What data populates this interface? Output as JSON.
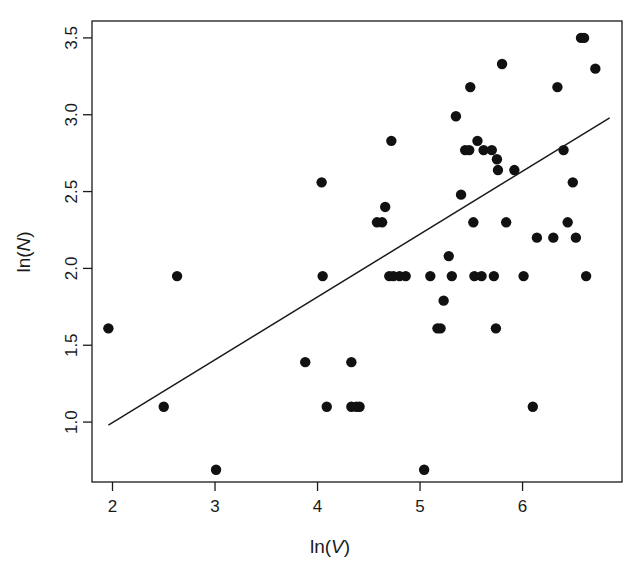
{
  "chart_data": {
    "type": "scatter",
    "title": "",
    "xlabel": "ln(V)",
    "ylabel": "ln(N)",
    "xlabel_parts": {
      "prefix": "ln(",
      "variable": "V",
      "suffix": ")"
    },
    "ylabel_parts": {
      "prefix": "ln(",
      "variable": "N",
      "suffix": ")"
    },
    "xlim": [
      1.8,
      6.97
    ],
    "ylim": [
      0.61,
      3.61
    ],
    "xticks": [
      2,
      3,
      4,
      5,
      6
    ],
    "xtick_labels": [
      "2",
      "3",
      "4",
      "5",
      "6"
    ],
    "yticks": [
      1.0,
      1.5,
      2.0,
      2.5,
      3.0,
      3.5
    ],
    "ytick_labels": [
      "1.0",
      "1.5",
      "2.0",
      "2.5",
      "3.0",
      "3.5"
    ],
    "grid": false,
    "legend": null,
    "point_color": "#111111",
    "point_size": 5.2,
    "line_color": "#1a1a1a",
    "frame": true,
    "x": [
      1.96,
      2.5,
      2.63,
      3.01,
      3.88,
      4.04,
      4.05,
      4.09,
      4.33,
      4.33,
      4.38,
      4.41,
      4.58,
      4.63,
      4.66,
      4.7,
      4.72,
      4.74,
      4.8,
      4.86,
      5.04,
      5.1,
      5.17,
      5.2,
      5.23,
      5.28,
      5.31,
      5.35,
      5.4,
      5.44,
      5.48,
      5.49,
      5.52,
      5.53,
      5.56,
      5.6,
      5.62,
      5.7,
      5.72,
      5.74,
      5.75,
      5.76,
      5.8,
      5.84,
      5.92,
      6.01,
      6.1,
      6.14,
      6.3,
      6.34,
      6.4,
      6.44,
      6.49,
      6.52,
      6.57,
      6.6,
      6.62,
      6.71
    ],
    "y": [
      1.61,
      1.1,
      1.95,
      0.69,
      1.39,
      2.56,
      1.95,
      1.1,
      1.39,
      1.1,
      1.1,
      1.1,
      2.3,
      2.3,
      2.4,
      1.95,
      2.83,
      1.95,
      1.95,
      1.95,
      0.69,
      1.95,
      1.61,
      1.61,
      1.79,
      2.08,
      1.95,
      2.99,
      2.48,
      2.77,
      2.77,
      3.18,
      2.3,
      1.95,
      2.83,
      1.95,
      2.77,
      2.77,
      1.95,
      1.61,
      2.71,
      2.64,
      3.33,
      2.3,
      2.64,
      1.95,
      1.1,
      2.2,
      2.2,
      3.18,
      2.77,
      2.3,
      2.56,
      2.2,
      3.5,
      3.5,
      1.95,
      3.3
    ],
    "fit_line": {
      "x_start": 1.96,
      "y_start": 0.98,
      "x_end": 6.85,
      "y_end": 2.98,
      "slope": 0.409,
      "intercept": 0.178
    }
  }
}
